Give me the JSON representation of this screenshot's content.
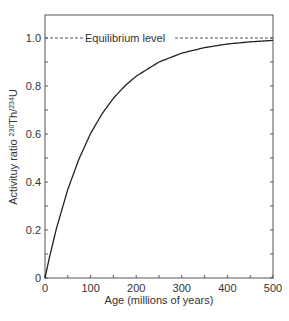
{
  "chart_data": {
    "type": "line",
    "title": "",
    "xlabel": "Age (millions of years)",
    "ylabel": "Activituy ratio ²³⁰Th/²³⁴U",
    "xlim": [
      0,
      500
    ],
    "ylim": [
      0,
      1.1
    ],
    "x_ticks": [
      0,
      100,
      200,
      300,
      400,
      500
    ],
    "x_minor_ticks": [
      50,
      150,
      250,
      350,
      450
    ],
    "y_ticks": [
      0,
      0.2,
      0.4,
      0.6,
      0.8,
      1.0
    ],
    "y_tick_labels": [
      "0",
      "0.2",
      "0.4",
      "0.6",
      "0.8",
      "1.0"
    ],
    "y_minor_ticks": [
      0.1,
      0.3,
      0.5,
      0.7,
      0.9
    ],
    "grid": false,
    "legend": null,
    "series": [
      {
        "name": "230Th/234U ingrowth",
        "x": [
          0,
          10,
          25,
          50,
          75,
          100,
          125,
          150,
          175,
          200,
          250,
          300,
          350,
          400,
          450,
          500
        ],
        "values": [
          0,
          0.088,
          0.206,
          0.369,
          0.498,
          0.602,
          0.684,
          0.749,
          0.8,
          0.841,
          0.9,
          0.937,
          0.96,
          0.975,
          0.984,
          0.99
        ]
      }
    ],
    "reference_lines": [
      {
        "y": 1.0,
        "style": "dashed",
        "label": "Equilibrium level"
      }
    ],
    "annotations": [
      {
        "text": "Equilibrium level",
        "x": 85,
        "y": 1.0
      }
    ]
  }
}
